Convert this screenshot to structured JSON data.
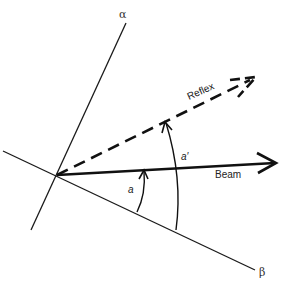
{
  "diagram": {
    "labels": {
      "alpha": "α",
      "beta": "β",
      "reflex": "Reflex",
      "beam": "Beam",
      "angle_a": "a",
      "angle_a_prime": "a′"
    },
    "elements": [
      {
        "name": "alpha-axis",
        "type": "line",
        "style": "solid-thin"
      },
      {
        "name": "beta-axis",
        "type": "line",
        "style": "solid-thin"
      },
      {
        "name": "beam-arrow",
        "type": "arrow",
        "style": "solid-thick"
      },
      {
        "name": "reflex-arrow",
        "type": "arrow",
        "style": "dashed-thick"
      },
      {
        "name": "angle-a-arc",
        "type": "arc-arrow",
        "from": "beta-axis",
        "to": "beam-arrow"
      },
      {
        "name": "angle-a-prime-arc",
        "type": "arc-arrow",
        "from": "beta-axis",
        "to": "reflex-arrow"
      }
    ],
    "colors": {
      "stroke": "#111111",
      "background": "#ffffff"
    }
  }
}
